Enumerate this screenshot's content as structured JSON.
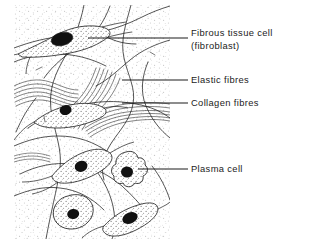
{
  "figure": {
    "kind": "biological-diagram",
    "canvas": {
      "width": 309,
      "height": 244
    },
    "drawing_area": {
      "x": 14,
      "y": 5,
      "width": 156,
      "height": 234
    },
    "colors": {
      "ink": "#1c1c1c",
      "stipple": "#b9b9b9",
      "cytoplasm_stipple": "#8a8a8a",
      "nucleus": "#111111",
      "background": "#ffffff",
      "leader_line": "#1c1c1c"
    }
  },
  "labels": [
    {
      "id": "fibrous-tissue-cell",
      "line1": "Fibrous tissue cell",
      "line2": "(fibroblast)",
      "leader": {
        "x1": 88,
        "y1": 38,
        "x2": 188,
        "y2": 38
      }
    },
    {
      "id": "elastic-fibres",
      "line1": "Elastic  fibres",
      "line2": "",
      "leader": {
        "x1": 122,
        "y1": 80,
        "x2": 188,
        "y2": 80
      }
    },
    {
      "id": "collagen-fibres",
      "line1": "Collagen  fibres",
      "line2": "",
      "leader": {
        "x1": 122,
        "y1": 103,
        "x2": 188,
        "y2": 103
      }
    },
    {
      "id": "plasma-cell",
      "line1": "Plasma  cell",
      "line2": "",
      "leader": {
        "x1": 138,
        "y1": 169,
        "x2": 188,
        "y2": 169
      }
    }
  ],
  "cells": [
    {
      "id": "fibroblast-top",
      "type": "fibroblast",
      "nucleus": {
        "cx": 62,
        "cy": 39,
        "rx": 11,
        "ry": 6.5
      }
    },
    {
      "id": "fibroblast-middle",
      "type": "fibroblast",
      "nucleus": {
        "cx": 66,
        "cy": 110,
        "rx": 6,
        "ry": 5
      }
    },
    {
      "id": "fibroblast-lower",
      "type": "fibroblast",
      "nucleus": {
        "cx": 81,
        "cy": 166,
        "rx": 6.5,
        "ry": 5.5
      }
    },
    {
      "id": "plasma-cell-right",
      "type": "plasma cell",
      "nucleus": {
        "cx": 127,
        "cy": 172,
        "rx": 6,
        "ry": 5.5
      }
    },
    {
      "id": "plasma-cell-bottom-left",
      "type": "plasma cell",
      "nucleus": {
        "cx": 73,
        "cy": 214,
        "rx": 6,
        "ry": 5
      }
    },
    {
      "id": "fibroblast-bottom-right",
      "type": "fibroblast",
      "nucleus": {
        "cx": 130,
        "cy": 218,
        "rx": 8,
        "ry": 5.5
      }
    }
  ],
  "fibre_bundles": [
    {
      "id": "collagen-bundle-left",
      "type": "collagen",
      "strands": 6
    },
    {
      "id": "collagen-bundle-centre",
      "type": "collagen",
      "strands": 7
    },
    {
      "id": "collagen-bundle-right",
      "type": "collagen",
      "strands": 6
    },
    {
      "id": "elastic-network",
      "type": "elastic",
      "strands": 9
    }
  ]
}
